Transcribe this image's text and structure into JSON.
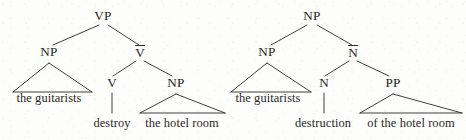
{
  "figure": {
    "kind": "syntax-tree-pair",
    "ink_color": "#2b2a28",
    "background_color": "#fdfdfc"
  },
  "trees": [
    {
      "id": "vp-tree",
      "name": "verb-phrase-tree",
      "root": "VP",
      "nodes": [
        {
          "id": "vp",
          "label": "VP",
          "bar": false,
          "x": 103,
          "y": 21
        },
        {
          "id": "np-spec",
          "label": "NP",
          "bar": false,
          "x": 49,
          "y": 57
        },
        {
          "id": "vbar",
          "label": "V",
          "bar": true,
          "x": 140,
          "y": 57
        },
        {
          "id": "v-head",
          "label": "V",
          "bar": false,
          "x": 112,
          "y": 88
        },
        {
          "id": "np-comp",
          "label": "NP",
          "bar": false,
          "x": 176,
          "y": 88
        }
      ],
      "terminals": [
        {
          "id": "t-guitarists",
          "text": "the guitarists",
          "x": 49,
          "y": 103,
          "triangle": true,
          "left": 13,
          "right": 92,
          "apex_x": 49,
          "apex_y": 63,
          "base_y": 92
        },
        {
          "id": "t-destroy",
          "text": "destroy",
          "x": 112,
          "y": 128,
          "triangle": false,
          "stem_x": 112,
          "stem_top": 93,
          "stem_bottom": 113
        },
        {
          "id": "t-hotel-room",
          "text": "the hotel room",
          "x": 182,
          "y": 128,
          "triangle": true,
          "left": 140,
          "right": 225,
          "apex_x": 176,
          "apex_y": 94,
          "base_y": 113
        }
      ],
      "branches": [
        {
          "from": "vp",
          "to": "np-spec",
          "x1": 99,
          "y1": 25,
          "x2": 53,
          "y2": 45
        },
        {
          "from": "vp",
          "to": "vbar",
          "x1": 108,
          "y1": 25,
          "x2": 139,
          "y2": 45
        },
        {
          "from": "vbar",
          "to": "v-head",
          "x1": 136,
          "y1": 61,
          "x2": 113,
          "y2": 76
        },
        {
          "from": "vbar",
          "to": "np-comp",
          "x1": 144,
          "y1": 61,
          "x2": 172,
          "y2": 76
        }
      ]
    },
    {
      "id": "np-tree",
      "name": "noun-phrase-tree",
      "root": "NP",
      "nodes": [
        {
          "id": "np-root",
          "label": "NP",
          "bar": false,
          "x": 312,
          "y": 21
        },
        {
          "id": "np-spec2",
          "label": "NP",
          "bar": false,
          "x": 267,
          "y": 57
        },
        {
          "id": "nbar",
          "label": "N",
          "bar": true,
          "x": 353,
          "y": 57
        },
        {
          "id": "n-head",
          "label": "N",
          "bar": false,
          "x": 324,
          "y": 88
        },
        {
          "id": "pp-comp",
          "label": "PP",
          "bar": false,
          "x": 393,
          "y": 88
        }
      ],
      "terminals": [
        {
          "id": "t-guitarists-2",
          "text": "the guitarists",
          "x": 268,
          "y": 103,
          "triangle": true,
          "left": 231,
          "right": 311,
          "apex_x": 267,
          "apex_y": 63,
          "base_y": 92
        },
        {
          "id": "t-destruction",
          "text": "destruction",
          "x": 323,
          "y": 128,
          "triangle": false,
          "stem_x": 324,
          "stem_top": 93,
          "stem_bottom": 113
        },
        {
          "id": "t-of-hotel-room",
          "text": "of the hotel room",
          "x": 411,
          "y": 128,
          "triangle": true,
          "left": 360,
          "right": 462,
          "apex_x": 393,
          "apex_y": 94,
          "base_y": 113
        }
      ],
      "branches": [
        {
          "from": "np-root",
          "to": "np-spec2",
          "x1": 307,
          "y1": 25,
          "x2": 271,
          "y2": 45
        },
        {
          "from": "np-root",
          "to": "nbar",
          "x1": 317,
          "y1": 25,
          "x2": 352,
          "y2": 45
        },
        {
          "from": "nbar",
          "to": "n-head",
          "x1": 349,
          "y1": 61,
          "x2": 325,
          "y2": 76
        },
        {
          "from": "nbar",
          "to": "pp-comp",
          "x1": 357,
          "y1": 61,
          "x2": 389,
          "y2": 76
        }
      ]
    }
  ]
}
